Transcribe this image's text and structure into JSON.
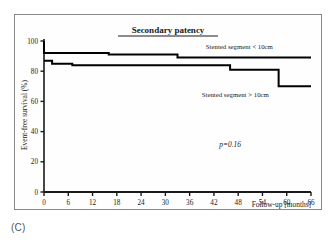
{
  "figure": {
    "panel_label": "(C)"
  },
  "chart_data": {
    "type": "line",
    "subtype": "kaplan-meier-step",
    "title": "Secondary patency",
    "xlabel": "Follow-up [months]",
    "ylabel": "Event-free survival (%)",
    "xlim": [
      0,
      66
    ],
    "ylim": [
      0,
      100
    ],
    "xticks": [
      0,
      6,
      12,
      18,
      24,
      30,
      36,
      42,
      48,
      54,
      60,
      66
    ],
    "xtick_labels": [
      "0",
      "6",
      "12",
      "18",
      "24",
      "30",
      "36",
      "42",
      "48",
      "54",
      "60",
      "66"
    ],
    "yticks": [
      0,
      20,
      40,
      60,
      80,
      100
    ],
    "ytick_labels": [
      "0",
      "20",
      "40",
      "60",
      "80",
      "100"
    ],
    "grid": false,
    "legend_position": "inline-annotation",
    "annotations": [
      {
        "name": "p-value",
        "text": "p=0.16",
        "x": 46,
        "y": 30
      }
    ],
    "series": [
      {
        "name": "Stented segment < 10cm",
        "label": "Stented segment < 10cm",
        "color": "#000000",
        "label_x": 40,
        "label_y": 95,
        "x": [
          0,
          0,
          16,
          33,
          66
        ],
        "y": [
          100,
          92,
          91,
          89,
          89
        ],
        "steps": [
          {
            "t": 0,
            "survival": 100
          },
          {
            "t": 0,
            "survival": 92
          },
          {
            "t": 16,
            "survival": 91
          },
          {
            "t": 33,
            "survival": 89
          },
          {
            "t": 66,
            "survival": 89
          }
        ]
      },
      {
        "name": "Stented segment > 10cm",
        "label": "Stented segment > 10cm",
        "color": "#000000",
        "label_x": 39,
        "label_y": 63,
        "x": [
          0,
          2,
          7,
          46,
          58,
          66
        ],
        "y": [
          87,
          85,
          84,
          81,
          70,
          70
        ],
        "steps": [
          {
            "t": 0,
            "survival": 87
          },
          {
            "t": 2,
            "survival": 85
          },
          {
            "t": 7,
            "survival": 84
          },
          {
            "t": 46,
            "survival": 81
          },
          {
            "t": 58,
            "survival": 70
          },
          {
            "t": 66,
            "survival": 70
          }
        ]
      }
    ]
  }
}
